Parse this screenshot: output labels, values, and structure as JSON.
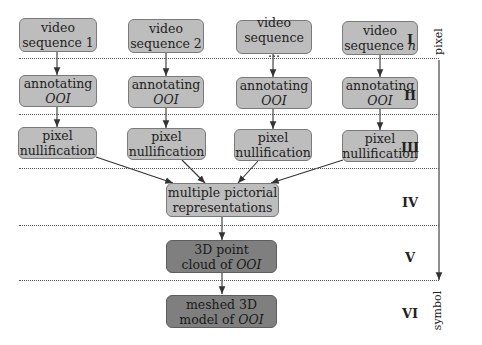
{
  "diagram": {
    "columns": [
      {
        "video": [
          "video",
          "sequence 1"
        ],
        "annotate": [
          "annotating",
          "OOI"
        ],
        "nullify": [
          "pixel",
          "nullification"
        ]
      },
      {
        "video": [
          "video",
          "sequence 2"
        ],
        "annotate": [
          "annotating",
          "OOI"
        ],
        "nullify": [
          "pixel",
          "nullification"
        ]
      },
      {
        "video": [
          "video",
          "sequence ..."
        ],
        "annotate": [
          "annotating",
          "OOI"
        ],
        "nullify": [
          "pixel",
          "nullification"
        ]
      },
      {
        "video": [
          "video",
          "sequence n"
        ],
        "annotate": [
          "annotating",
          "OOI"
        ],
        "nullify": [
          "pixel",
          "nullification"
        ]
      }
    ],
    "merge": [
      "multiple pictorial",
      "representations"
    ],
    "pointcloud": {
      "line1": "3D point",
      "line2_prefix": "cloud of ",
      "line2_italic": "OOI"
    },
    "mesh": {
      "line1": "meshed 3D",
      "line2_prefix": "model of ",
      "line2_italic": "OOI"
    },
    "stages": [
      "I",
      "II",
      "III",
      "IV",
      "V",
      "VI"
    ],
    "axis": {
      "top": "pixel",
      "bottom": "symbol"
    },
    "colors": {
      "light_box": "#bdbdbd",
      "dark_box": "#7f7f7f",
      "border": "#7a7a7a"
    }
  }
}
